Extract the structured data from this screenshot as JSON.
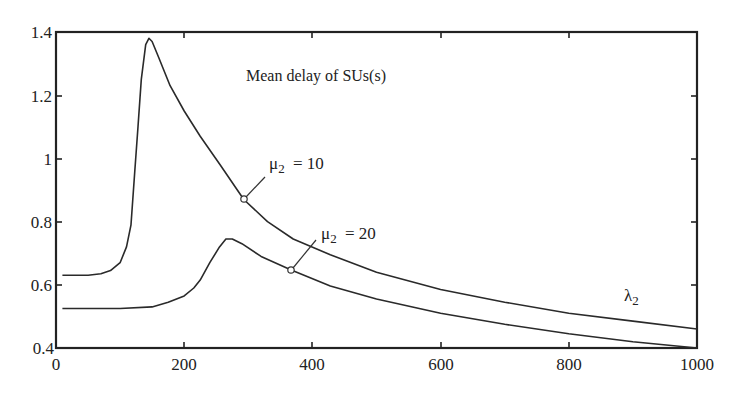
{
  "chart_data": {
    "type": "line",
    "title": "Mean delay of SUs(s)",
    "xlabel": "λ2",
    "ylabel": "",
    "xlim": [
      0,
      1000
    ],
    "ylim": [
      0.4,
      1.4
    ],
    "grid": false,
    "x_ticks": [
      0,
      200,
      400,
      600,
      800,
      1000
    ],
    "x_tick_labels": [
      "0",
      "200",
      "400",
      "600",
      "800",
      "1000"
    ],
    "y_ticks": [
      0.4,
      0.6,
      0.8,
      1.0,
      1.2,
      1.4
    ],
    "y_tick_labels": [
      "0.4",
      "0.6",
      "0.8",
      "1",
      "1.2",
      "1.4"
    ],
    "series": [
      {
        "name": "μ2 = 10",
        "x": [
          10,
          50,
          70,
          85,
          100,
          110,
          117,
          123,
          128,
          133,
          140,
          145,
          150,
          160,
          178,
          200,
          225,
          256,
          293,
          330,
          370,
          428,
          500,
          600,
          700,
          800,
          900,
          1000
        ],
        "y": [
          0.63,
          0.63,
          0.635,
          0.645,
          0.67,
          0.72,
          0.79,
          0.96,
          1.1,
          1.25,
          1.36,
          1.38,
          1.37,
          1.32,
          1.23,
          1.15,
          1.07,
          0.98,
          0.87,
          0.8,
          0.745,
          0.695,
          0.64,
          0.585,
          0.545,
          0.51,
          0.485,
          0.46
        ]
      },
      {
        "name": "μ2 = 20",
        "x": [
          10,
          100,
          150,
          175,
          200,
          215,
          225,
          240,
          255,
          265,
          275,
          290,
          320,
          367,
          428,
          500,
          600,
          700,
          800,
          900,
          1000
        ],
        "y": [
          0.525,
          0.525,
          0.53,
          0.545,
          0.565,
          0.59,
          0.615,
          0.67,
          0.72,
          0.745,
          0.745,
          0.73,
          0.69,
          0.647,
          0.596,
          0.555,
          0.51,
          0.475,
          0.445,
          0.42,
          0.4
        ]
      }
    ],
    "annotations": [
      {
        "text": "Mean delay of SUs(s)",
        "x": 310,
        "y": 1.21
      },
      {
        "text": "μ2  = 10",
        "marker_x": 293,
        "marker_y": 0.87
      },
      {
        "text": "μ2  = 20",
        "marker_x": 367,
        "marker_y": 0.647
      },
      {
        "text": "λ2",
        "x": 950,
        "y": 0.52
      }
    ]
  },
  "labels": {
    "title": "Mean delay of SUs(s)",
    "mu10_base": "μ",
    "mu10_sub": "2",
    "mu10_val": " = 10",
    "mu20_base": "μ",
    "mu20_sub": "2",
    "mu20_val": " = 20",
    "lambda_base": "λ",
    "lambda_sub": "2",
    "xt0": "0",
    "xt1": "200",
    "xt2": "400",
    "xt3": "600",
    "xt4": "800",
    "xt5": "1000",
    "yt0": "0.4",
    "yt1": "0.6",
    "yt2": "0.8",
    "yt3": "1",
    "yt4": "1.2",
    "yt5": "1.4"
  }
}
